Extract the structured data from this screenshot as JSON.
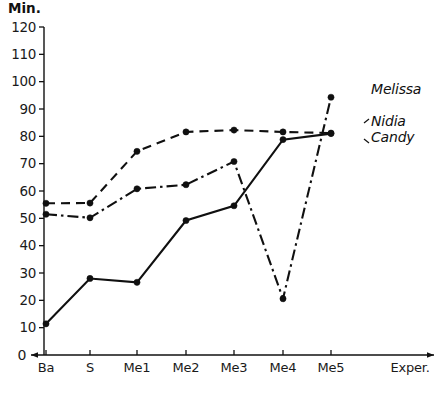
{
  "chart_data": {
    "type": "line",
    "title": "",
    "ylabel": "Min.",
    "xlabel": "Exper.",
    "ylim": [
      0,
      120
    ],
    "yticks": [
      10,
      20,
      30,
      40,
      50,
      60,
      70,
      80,
      90,
      100,
      110,
      120
    ],
    "origin_label": "0",
    "grid": false,
    "legend_position": "right-inline",
    "categories": [
      "Ba",
      "S",
      "Me1",
      "Me2",
      "Me3",
      "Me4",
      "Me5"
    ],
    "series": [
      {
        "name": "Melissa",
        "line_style": "dash-dot",
        "values": [
          51.5,
          50.2,
          60.8,
          62.3,
          70.8,
          20.6,
          94.3
        ]
      },
      {
        "name": "Nidia",
        "line_style": "dashed",
        "values": [
          55.5,
          55.6,
          74.5,
          81.6,
          82.3,
          81.6,
          81.2
        ]
      },
      {
        "name": "Candy",
        "line_style": "solid",
        "values": [
          11.4,
          28.0,
          26.6,
          49.2,
          54.6,
          78.8,
          81.0
        ]
      }
    ]
  },
  "legend": {
    "entries": [
      {
        "label": "Melissa"
      },
      {
        "label": "Nidia"
      },
      {
        "label": "Candy"
      }
    ]
  },
  "axis": {
    "y_title": "Min.",
    "x_end_label": "Exper.",
    "origin": "0"
  }
}
